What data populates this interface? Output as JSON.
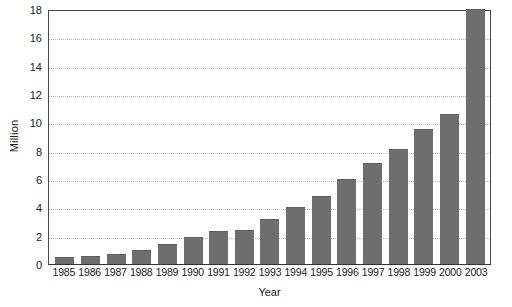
{
  "chart_data": {
    "type": "bar",
    "title": "",
    "xlabel": "Year",
    "ylabel": "Million",
    "categories": [
      "1985",
      "1986",
      "1987",
      "1988",
      "1989",
      "1990",
      "1991",
      "1992",
      "1993",
      "1994",
      "1995",
      "1996",
      "1997",
      "1998",
      "1999",
      "2000",
      "2003"
    ],
    "values": [
      0.5,
      0.6,
      0.7,
      1.0,
      1.4,
      1.9,
      2.3,
      2.4,
      3.2,
      4.0,
      4.8,
      6.0,
      7.1,
      8.1,
      9.5,
      10.6,
      18.2
    ],
    "ylim": [
      0,
      18
    ],
    "yticks": [
      0,
      2,
      4,
      6,
      8,
      10,
      12,
      14,
      16,
      18
    ],
    "ytick_labels": [
      "0",
      "2",
      "4",
      "6",
      "8",
      "10",
      "12",
      "14",
      "16",
      "18"
    ],
    "grid": true,
    "grid_axis": "y",
    "grid_style": "dotted",
    "legend": null,
    "bar_color": "#6e6e6e",
    "axis_color": "#4a4a4a",
    "gridline_color": "#b9b9b9",
    "background": "#ffffff"
  }
}
